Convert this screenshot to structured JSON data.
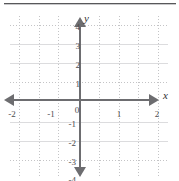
{
  "figure": {
    "kind": "coordinate-plane",
    "divider_color": "#58585a",
    "axis_color": "#6d6d70",
    "grid_color": "#c4c4c6",
    "label_color": "#4c4c4e"
  },
  "chart_data": {
    "type": "scatter",
    "title": "",
    "subtitle": "",
    "xlabel": "x",
    "ylabel": "y",
    "xlim": [
      -2,
      2
    ],
    "ylim": [
      -4,
      4
    ],
    "x_tick_labels": [
      "-2",
      "-1",
      "0",
      "1",
      "2"
    ],
    "x_ticks": [
      -2,
      -1,
      0,
      1,
      2
    ],
    "y_tick_labels": [
      "4",
      "3",
      "2",
      "1",
      "0",
      "-1",
      "-2",
      "-3",
      "-4"
    ],
    "y_ticks": [
      4,
      3,
      2,
      1,
      0,
      -1,
      -2,
      -3,
      -4
    ],
    "x_minor_step": 0.5,
    "y_minor_step": 1,
    "grid": true,
    "grid_style": "dotted",
    "legend": null,
    "series": [],
    "annotations": [],
    "axis_arrows": [
      "x-left",
      "x-right",
      "y-up",
      "y-down"
    ],
    "origin_label": "0"
  },
  "axis_names": {
    "x": "x",
    "y": "y"
  },
  "x_labels": [
    {
      "text": "-2",
      "left": 3,
      "top": 101
    },
    {
      "text": "-1",
      "left": 42,
      "top": 101
    },
    {
      "text": "0",
      "left": 68,
      "top": 97
    },
    {
      "text": "1",
      "left": 110,
      "top": 101
    },
    {
      "text": "2",
      "left": 148,
      "top": 101
    }
  ],
  "y_labels": [
    {
      "text": "4",
      "left": 62,
      "top": 14
    },
    {
      "text": "3",
      "left": 62,
      "top": 33
    },
    {
      "text": "2",
      "left": 62,
      "top": 52
    },
    {
      "text": "1",
      "left": 62,
      "top": 71
    },
    {
      "text": "-1",
      "left": 58,
      "top": 111
    },
    {
      "text": "-2",
      "left": 58,
      "top": 130
    },
    {
      "text": "-3",
      "left": 58,
      "top": 149
    },
    {
      "text": "-4",
      "left": 58,
      "top": 167
    }
  ],
  "grid_vertical_x": [
    19,
    39,
    58,
    99,
    119,
    138,
    158
  ],
  "grid_horizontal_y": [
    17,
    36,
    55,
    74,
    114,
    133,
    152
  ],
  "grid_horizontal_strong_y": [
    36,
    55,
    114,
    133
  ]
}
